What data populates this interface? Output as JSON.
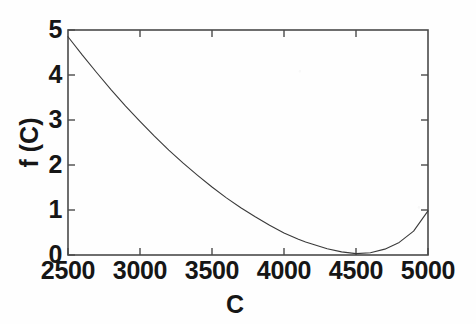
{
  "figure": {
    "background_color": "#fefefe",
    "ink_color": "#3a3a3a",
    "text_color": "#161616"
  },
  "chart_data": {
    "type": "line",
    "title": "",
    "subtitle": "",
    "xlabel": "C",
    "ylabel": "f (C)",
    "xlim": [
      2500,
      5000
    ],
    "ylim": [
      0,
      5
    ],
    "xticks": [
      2500,
      3000,
      3500,
      4000,
      4500,
      5000
    ],
    "xticklabels": [
      "2500",
      "3000",
      "3500",
      "4000",
      "4500",
      "5000"
    ],
    "yticks": [
      0,
      1,
      2,
      3,
      4,
      5
    ],
    "yticklabels": [
      "0",
      "1",
      "2",
      "3",
      "4",
      "5"
    ],
    "grid": false,
    "legend": null,
    "box": true,
    "tick_direction": "in",
    "ticks_on_all_sides": true,
    "annotations": [],
    "series": [
      {
        "name": "f(C)",
        "color": "#3a3a3a",
        "linewidth": 1.1,
        "x": [
          2500,
          2600,
          2700,
          2800,
          2900,
          3000,
          3100,
          3200,
          3300,
          3400,
          3500,
          3600,
          3700,
          3800,
          3900,
          4000,
          4100,
          4150,
          4200,
          4300,
          4400,
          4500,
          4600,
          4700,
          4800,
          4900,
          5000
        ],
        "y": [
          4.85,
          4.44,
          4.05,
          3.67,
          3.31,
          2.97,
          2.64,
          2.33,
          2.04,
          1.77,
          1.51,
          1.27,
          1.05,
          0.85,
          0.66,
          0.49,
          0.35,
          0.29,
          0.24,
          0.14,
          0.07,
          0.03,
          0.05,
          0.13,
          0.28,
          0.53,
          0.98
        ]
      }
    ],
    "minimum": {
      "x": 4150,
      "y": 0.0
    },
    "endpoints": {
      "left": {
        "x": 2500,
        "y": 4.85
      },
      "right": {
        "x": 5000,
        "y": 0.98
      }
    }
  },
  "axes": {
    "x_tick_labels": [
      "2500",
      "3000",
      "3500",
      "4000",
      "4500",
      "5000"
    ],
    "y_tick_labels": [
      "0",
      "1",
      "2",
      "3",
      "4",
      "5"
    ],
    "x_axis_label": "C",
    "y_axis_label": "f (C)"
  }
}
